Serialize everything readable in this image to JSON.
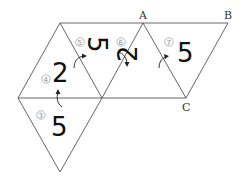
{
  "diagram": {
    "vertex_labels": {
      "A": "A",
      "B": "B",
      "C": "C"
    },
    "steps": [
      {
        "number": "③",
        "glyph": "5"
      },
      {
        "number": "④",
        "glyph": "2"
      },
      {
        "number": "⑤",
        "glyph": "5"
      },
      {
        "number": "⑥",
        "glyph": "2"
      },
      {
        "number": "⑦",
        "glyph": "5"
      }
    ]
  }
}
